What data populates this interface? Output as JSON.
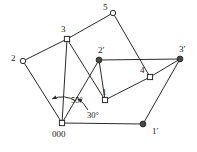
{
  "figure": {
    "background_color": "#ffffff",
    "line_color": "#2b2b2b",
    "node_open_fill": "#ffffff",
    "node_filled_fill": "#4a4a4a",
    "width": 197,
    "height": 152
  },
  "nodes": [
    {
      "id": "n5",
      "label": "5",
      "marker": "open-circle",
      "x": 113,
      "y": 13,
      "label_x": 103,
      "label_y": 3
    },
    {
      "id": "n3",
      "label": "3",
      "marker": "open-square",
      "x": 67,
      "y": 39,
      "label_x": 61,
      "label_y": 25
    },
    {
      "id": "n2",
      "label": "2",
      "marker": "open-circle",
      "x": 23,
      "y": 61,
      "label_x": 11,
      "label_y": 54
    },
    {
      "id": "n2p",
      "label": "2′",
      "marker": "filled-circle",
      "x": 99,
      "y": 60,
      "label_x": 98,
      "label_y": 46
    },
    {
      "id": "n3p",
      "label": "3′",
      "marker": "filled-circle",
      "x": 180,
      "y": 59,
      "label_x": 179,
      "label_y": 45
    },
    {
      "id": "n4",
      "label": "4",
      "marker": "open-square",
      "x": 150,
      "y": 77,
      "label_x": 140,
      "label_y": 66
    },
    {
      "id": "n1",
      "label": "1",
      "marker": "open-square",
      "x": 105,
      "y": 100,
      "label_x": 102,
      "label_y": 88
    },
    {
      "id": "n000",
      "label": "000",
      "marker": "open-square",
      "x": 62,
      "y": 123,
      "label_x": 52,
      "label_y": 130
    },
    {
      "id": "n1p",
      "label": "1′",
      "marker": "filled-circle",
      "x": 143,
      "y": 124,
      "label_x": 152,
      "label_y": 127
    }
  ],
  "edges": [
    {
      "from": "n2",
      "to": "n3"
    },
    {
      "from": "n2",
      "to": "n000"
    },
    {
      "from": "n3",
      "to": "n5"
    },
    {
      "from": "n3",
      "to": "n000"
    },
    {
      "from": "n3",
      "to": "n1"
    },
    {
      "from": "n5",
      "to": "n4"
    },
    {
      "from": "n2p",
      "to": "n3p"
    },
    {
      "from": "n2p",
      "to": "n1"
    },
    {
      "from": "n2p",
      "to": "n000"
    },
    {
      "from": "n1",
      "to": "n4"
    },
    {
      "from": "n4",
      "to": "n3p"
    },
    {
      "from": "n3p",
      "to": "n1p"
    },
    {
      "from": "n000",
      "to": "n1p"
    }
  ],
  "angles": [
    {
      "id": "a55",
      "label": "55°",
      "label_x": 71,
      "label_y": 96,
      "vertex_x": 62,
      "vertex_y": 123,
      "radius": 26,
      "start_deg": 248,
      "end_deg": 303
    },
    {
      "id": "a30",
      "label": "30°",
      "label_x": 87,
      "label_y": 111,
      "vertex_x": 62,
      "vertex_y": 123,
      "radius": 29,
      "start_deg": 303,
      "end_deg": 333
    }
  ]
}
